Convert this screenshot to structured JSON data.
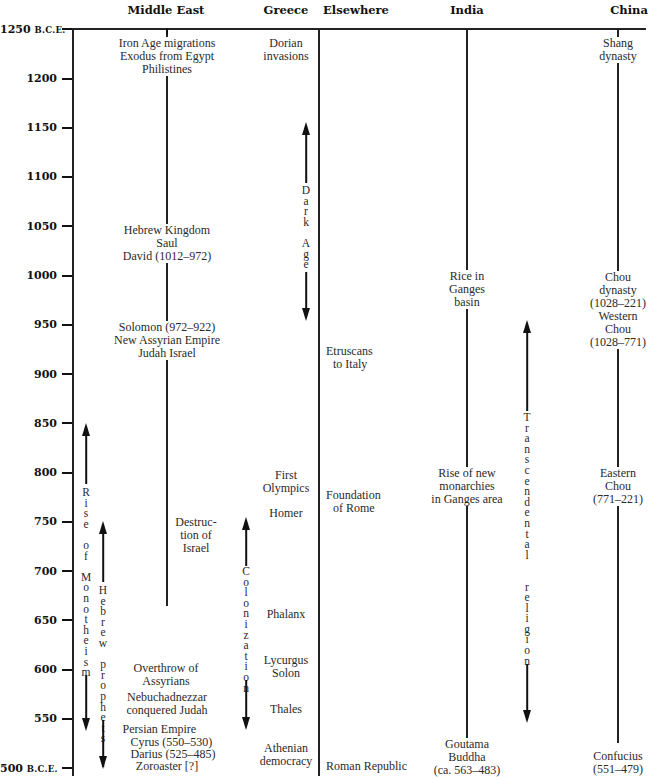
{
  "chart_data": {
    "type": "table",
    "ylabel": "Year (B.C.E.)",
    "ylim": [
      1250,
      500
    ],
    "y_ticks": [
      "1250 B.C.E.",
      "1200",
      "1150",
      "1100",
      "1050",
      "1000",
      "950",
      "900",
      "850",
      "800",
      "750",
      "700",
      "650",
      "600",
      "550",
      "500 B.C.E."
    ],
    "columns": [
      "Middle East",
      "Greece",
      "Elsewhere",
      "India",
      "China"
    ],
    "events": {
      "middle_east": [
        {
          "year": 1240,
          "text": [
            "Iron Age migrations",
            "Exodus from Egypt",
            "Philistines"
          ]
        },
        {
          "year": 1030,
          "text": [
            "Hebrew Kingdom",
            "Saul",
            "David (1012–972)"
          ]
        },
        {
          "year": 930,
          "text": [
            "Solomon (972–922)",
            "New Assyrian Empire",
            "Judah Israel"
          ]
        },
        {
          "year": 722,
          "text": [
            "Destruc-",
            "tion of",
            "Israel"
          ]
        },
        {
          "year": 605,
          "text": [
            "Overthrow of",
            "Assyrians"
          ]
        },
        {
          "year": 565,
          "text": [
            "Nebuchadnezzar",
            "conquered Judah"
          ]
        },
        {
          "year": 530,
          "text": [
            "Persian Empire",
            "Cyrus (550–530)",
            "Darius (525–485)"
          ]
        },
        {
          "year": 502,
          "text": [
            "Zoroaster [?]"
          ]
        }
      ],
      "greece": [
        {
          "year": 1240,
          "text": [
            "Dorian",
            "invasions"
          ]
        },
        {
          "year": 785,
          "text": [
            "First",
            "Olympics"
          ]
        },
        {
          "year": 755,
          "text": [
            "Homer"
          ]
        },
        {
          "year": 650,
          "text": [
            "Phalanx"
          ]
        },
        {
          "year": 600,
          "text": [
            "Lycurgus",
            "Solon"
          ]
        },
        {
          "year": 550,
          "text": [
            "Thales"
          ]
        },
        {
          "year": 510,
          "text": [
            "Athenian",
            "democracy"
          ]
        }
      ],
      "elsewhere": [
        {
          "year": 915,
          "text": [
            "Etruscans",
            "to Italy"
          ]
        },
        {
          "year": 765,
          "text": [
            "Foundation",
            "of Rome"
          ]
        },
        {
          "year": 500,
          "text": [
            "Roman Republic"
          ]
        }
      ],
      "india": [
        {
          "year": 990,
          "text": [
            "Rice in",
            "Ganges",
            "basin"
          ]
        },
        {
          "year": 775,
          "text": [
            "Rise of new",
            "monarchies",
            "in Ganges area"
          ]
        },
        {
          "year": 515,
          "text": [
            "Goutama",
            "Buddha",
            "(ca. 563–483)"
          ]
        }
      ],
      "china": [
        {
          "year": 1240,
          "text": [
            "Shang",
            "dynasty"
          ]
        },
        {
          "year": 975,
          "text": [
            "Chou",
            "dynasty",
            "(1028–221)",
            "Western",
            "Chou",
            "(1028–771)"
          ]
        },
        {
          "year": 775,
          "text": [
            "Eastern",
            "Chou",
            "(771–221)"
          ]
        },
        {
          "year": 505,
          "text": [
            "Confucius",
            "(551–479)"
          ]
        }
      ]
    },
    "spans": [
      {
        "label": "Dark Age",
        "column": "Greece",
        "from": 1150,
        "to": 950
      },
      {
        "label": "Colonization",
        "column": "Greece",
        "from": 750,
        "to": 550
      },
      {
        "label": "Rise of Monotheism",
        "column": "Middle East",
        "from": 850,
        "to": 550
      },
      {
        "label": "Hebrew prophets",
        "column": "Middle East",
        "from": 750,
        "to": 500
      },
      {
        "label": "Transcendental religion",
        "column": "India",
        "from": 960,
        "to": 550
      }
    ]
  },
  "headers": {
    "middle_east": "Middle East",
    "greece": "Greece",
    "elsewhere": "Elsewhere",
    "india": "India",
    "china": "China"
  },
  "ticks": {
    "t1250": "1250",
    "t1250_suffix": "B.C.E.",
    "t1200": "1200",
    "t1150": "1150",
    "t1100": "1100",
    "t1050": "1050",
    "t1000": "1000",
    "t950": "950",
    "t900": "900",
    "t850": "850",
    "t800": "800",
    "t750": "750",
    "t700": "700",
    "t650": "650",
    "t600": "600",
    "t550": "550",
    "t500": "500",
    "t500_suffix": "B.C.E."
  },
  "me": {
    "e1": [
      "Iron Age migrations",
      "Exodus from Egypt",
      "Philistines"
    ],
    "e2": [
      "Hebrew Kingdom",
      "Saul",
      "David (1012–972)"
    ],
    "e3": [
      "Solomon (972–922)",
      "New Assyrian Empire",
      "Judah Israel"
    ],
    "e4": [
      "Destruc-",
      "tion of",
      "Israel"
    ],
    "e5": [
      "Overthrow of",
      "Assyrians"
    ],
    "e6": [
      "Nebuchadnezzar",
      "conquered Judah"
    ],
    "e7": [
      "Persian Empire",
      "Cyrus (550–530)",
      "Darius (525–485)"
    ],
    "e8": "Zoroaster [?]"
  },
  "gr": {
    "e1": [
      "Dorian",
      "invasions"
    ],
    "e2": [
      "First",
      "Olympics"
    ],
    "e3": "Homer",
    "e4": "Phalanx",
    "e5": [
      "Lycurgus",
      "Solon"
    ],
    "e6": "Thales",
    "e7": [
      "Athenian",
      "democracy"
    ]
  },
  "el": {
    "e1": [
      "Etruscans",
      "to Italy"
    ],
    "e2": [
      "Foundation",
      "of Rome"
    ],
    "e3": "Roman Republic"
  },
  "in": {
    "e1": [
      "Rice in",
      "Ganges",
      "basin"
    ],
    "e2": [
      "Rise of new",
      "monarchies",
      "in Ganges area"
    ],
    "e3": [
      "Goutama",
      "Buddha",
      "(ca. 563–483)"
    ]
  },
  "cn": {
    "e1": [
      "Shang",
      "dynasty"
    ],
    "e2": [
      "Chou",
      "dynasty",
      "(1028–221)",
      "Western",
      "Chou",
      "(1028–771)"
    ],
    "e3": [
      "Eastern",
      "Chou",
      "(771–221)"
    ],
    "e4": [
      "Confucius",
      "(551–479)"
    ]
  },
  "spans": {
    "dark_age": [
      "D",
      "a",
      "r",
      "k",
      "",
      "A",
      "g",
      "e"
    ],
    "colonization": [
      "C",
      "o",
      "l",
      "o",
      "n",
      "i",
      "z",
      "a",
      "t",
      "i",
      "o",
      "n"
    ],
    "monotheism": [
      "R",
      "i",
      "s",
      "e",
      "",
      "o",
      "f",
      "",
      "M",
      "o",
      "n",
      "o",
      "t",
      "h",
      "e",
      "i",
      "s",
      "m"
    ],
    "prophets": [
      "H",
      "e",
      "b",
      "r",
      "e",
      "w",
      "",
      "p",
      "r",
      "o",
      "p",
      "h",
      "e",
      "t",
      "s"
    ],
    "transcendental": [
      "T",
      "r",
      "a",
      "n",
      "s",
      "c",
      "e",
      "n",
      "d",
      "e",
      "n",
      "t",
      "a",
      "l",
      "",
      "",
      "r",
      "e",
      "l",
      "i",
      "g",
      "i",
      "o",
      "n"
    ]
  }
}
